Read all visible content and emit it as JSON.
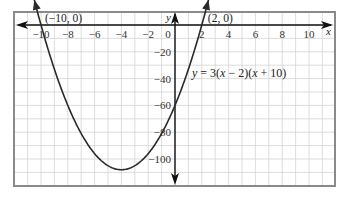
{
  "chart_data": {
    "type": "line",
    "title": "",
    "equation": "y = 3(x − 2)(x + 10)",
    "function": {
      "a": 3,
      "roots": [
        2,
        -10
      ]
    },
    "xlabel": "x",
    "ylabel": "y",
    "xlim": [
      -11.8,
      12
    ],
    "ylim": [
      -120,
      10
    ],
    "x_ticks": [
      -10,
      -8,
      -6,
      -4,
      -2,
      0,
      2,
      4,
      6,
      8,
      10
    ],
    "x_tick_labels": [
      "−10",
      "−8",
      "−6",
      "−4",
      "−2",
      "0",
      "2",
      "4",
      "6",
      "8",
      "10"
    ],
    "y_ticks": [
      -20,
      -40,
      -60,
      -80,
      -100
    ],
    "y_tick_labels": [
      "−20",
      "−40",
      "−60",
      "−80",
      "−100"
    ],
    "grid": true,
    "grid_x_step": 1,
    "grid_y_step": 10,
    "points": [
      {
        "x": -10,
        "y": 0,
        "label": "(−10, 0)"
      },
      {
        "x": 2,
        "y": 0,
        "label": "(2, 0)"
      }
    ],
    "vertex": {
      "x": -4,
      "y": -108
    },
    "y_intercept": -60,
    "series": [
      {
        "name": "y = 3(x − 2)(x + 10)",
        "x_range": [
          -10.5,
          2.5
        ]
      }
    ],
    "legend": "none"
  },
  "colors": {
    "grid": "#d4d4d4",
    "frame": "#8a8a8a",
    "axis": "#111111",
    "curve": "#2a2a2a"
  }
}
